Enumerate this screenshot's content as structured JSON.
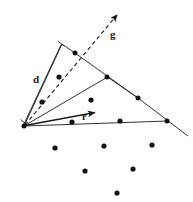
{
  "figure": {
    "background_color": "#ffffff",
    "stroke_color": "#1a1a1a",
    "point_color": "#111111",
    "width": 193,
    "height": 202,
    "labels": [
      {
        "id": "d",
        "text": "d",
        "x": 33,
        "y": 74
      },
      {
        "id": "g",
        "text": "g",
        "x": 110,
        "y": 29
      },
      {
        "id": "r",
        "text": "r",
        "x": 82,
        "y": 112
      }
    ],
    "apex": {
      "x": 24,
      "y": 126
    },
    "rays": [
      {
        "name": "cone-left-boundary-ray",
        "style": "solid",
        "from": {
          "x": 24,
          "y": 126
        },
        "to": {
          "x": 62,
          "y": 44
        },
        "arrow": false
      },
      {
        "name": "direction-vector-g-ray",
        "style": "dashed",
        "from": {
          "x": 24,
          "y": 126
        },
        "to": {
          "x": 119,
          "y": 13
        },
        "arrow": true
      },
      {
        "name": "cone-inner-ray-upper",
        "style": "solid",
        "from": {
          "x": 24,
          "y": 126
        },
        "to": {
          "x": 107,
          "y": 77
        },
        "arrow": false
      },
      {
        "name": "cone-inner-ray-lower",
        "style": "solid",
        "from": {
          "x": 24,
          "y": 126
        },
        "to": {
          "x": 167,
          "y": 121
        },
        "arrow": false
      },
      {
        "name": "radius-vector-r-ray",
        "style": "solid",
        "from": {
          "x": 24,
          "y": 126
        },
        "to": {
          "x": 99,
          "y": 112
        },
        "arrow": true
      }
    ],
    "segments": [
      {
        "name": "cone-top-chord-left",
        "from": {
          "x": 62,
          "y": 44
        },
        "to": {
          "x": 75,
          "y": 53
        }
      },
      {
        "name": "cone-top-chord-right",
        "from": {
          "x": 75,
          "y": 53
        },
        "to": {
          "x": 138,
          "y": 98
        }
      },
      {
        "name": "hull-edge-middle",
        "from": {
          "x": 107,
          "y": 77
        },
        "to": {
          "x": 138,
          "y": 98
        }
      },
      {
        "name": "hull-edge-lower-right",
        "from": {
          "x": 138,
          "y": 98
        },
        "to": {
          "x": 188,
          "y": 136
        }
      }
    ],
    "bracket_d": {
      "name": "distance-bracket-d",
      "from": {
        "x": 24,
        "y": 124
      },
      "to": {
        "x": 61,
        "y": 45
      },
      "tick_length": 6
    },
    "points": [
      {
        "id": "p-apex",
        "x": 24,
        "y": 126,
        "on_boundary": true
      },
      {
        "id": "p-cone-upper",
        "x": 75,
        "y": 53,
        "on_boundary": true
      },
      {
        "id": "p-cone-mid",
        "x": 107,
        "y": 77,
        "on_boundary": true
      },
      {
        "id": "p-cone-right",
        "x": 138,
        "y": 98,
        "on_boundary": true
      },
      {
        "id": "p-edge-right",
        "x": 167,
        "y": 121,
        "on_boundary": true
      },
      {
        "id": "p-in-1",
        "x": 59,
        "y": 77,
        "on_boundary": false
      },
      {
        "id": "p-in-2",
        "x": 42,
        "y": 102,
        "on_boundary": false
      },
      {
        "id": "p-in-3",
        "x": 91,
        "y": 100,
        "on_boundary": false
      },
      {
        "id": "p-in-4",
        "x": 72,
        "y": 122,
        "on_boundary": false
      },
      {
        "id": "p-in-5",
        "x": 120,
        "y": 121,
        "on_boundary": false
      },
      {
        "id": "p-out-1",
        "x": 55,
        "y": 148,
        "on_boundary": false
      },
      {
        "id": "p-out-2",
        "x": 104,
        "y": 146,
        "on_boundary": false
      },
      {
        "id": "p-out-3",
        "x": 152,
        "y": 145,
        "on_boundary": false
      },
      {
        "id": "p-out-4",
        "x": 85,
        "y": 171,
        "on_boundary": false
      },
      {
        "id": "p-out-5",
        "x": 133,
        "y": 169,
        "on_boundary": false
      },
      {
        "id": "p-out-6",
        "x": 117,
        "y": 193,
        "on_boundary": false
      }
    ]
  }
}
